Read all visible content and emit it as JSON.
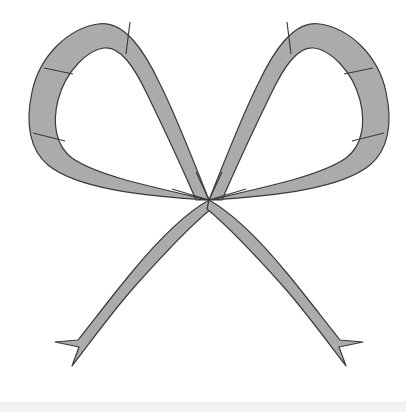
{
  "canvas": {
    "width": 406,
    "height": 412,
    "background_color": "#ffffff",
    "title": "Ribbon Bow Outline Illustration"
  },
  "illustration": {
    "name": "ribbon-bow",
    "description": "Symmetric decorative ribbon bow with two upper loops, a central knot point, and two crossing notched tails",
    "fill_color": "#ababab",
    "stroke_color": "#3a3a3a",
    "stroke_width": 1.2,
    "knot_point": {
      "x": 209,
      "y": 200
    },
    "parts": [
      {
        "name": "left-loop",
        "label": "Left Loop"
      },
      {
        "name": "right-loop",
        "label": "Right Loop"
      },
      {
        "name": "left-tail",
        "label": "Left Tail"
      },
      {
        "name": "right-tail",
        "label": "Right Tail"
      }
    ],
    "segment_dividers": [
      {
        "name": "left-loop-divider-top",
        "x1": 130,
        "y1": 22,
        "x2": 126,
        "y2": 54
      },
      {
        "name": "left-loop-divider-left",
        "x1": 44,
        "y1": 68,
        "x2": 73,
        "y2": 74
      },
      {
        "name": "left-loop-divider-lower",
        "x1": 33,
        "y1": 133,
        "x2": 65,
        "y2": 141
      },
      {
        "name": "right-loop-divider-top",
        "x1": 287,
        "y1": 22,
        "x2": 291,
        "y2": 54
      },
      {
        "name": "right-loop-divider-right",
        "x1": 373,
        "y1": 68,
        "x2": 344,
        "y2": 74
      },
      {
        "name": "right-loop-divider-lower",
        "x1": 384,
        "y1": 133,
        "x2": 352,
        "y2": 141
      }
    ],
    "extents": {
      "left_x": 31,
      "right_x": 379,
      "top_y": 20,
      "bottom_y": 366
    }
  },
  "bottom_band": {
    "name": "bottom-strip",
    "color": "#f2f2f3",
    "height_px": 10
  }
}
